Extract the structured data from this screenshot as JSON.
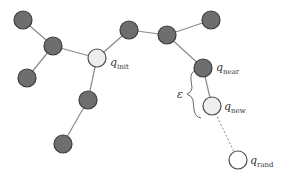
{
  "diagram": {
    "title": "",
    "type": "rrt-tree",
    "colors": {
      "node_dark": "#6e6e6e",
      "node_light": "#eeeeee",
      "edge": "#8a8a8a"
    },
    "labels": {
      "q_init": {
        "base": "q",
        "sub": "init"
      },
      "q_near": {
        "base": "q",
        "sub": "near"
      },
      "q_new": {
        "base": "q",
        "sub": "new"
      },
      "q_rand": {
        "base": "q",
        "sub": "rand"
      },
      "epsilon": "ε"
    }
  }
}
